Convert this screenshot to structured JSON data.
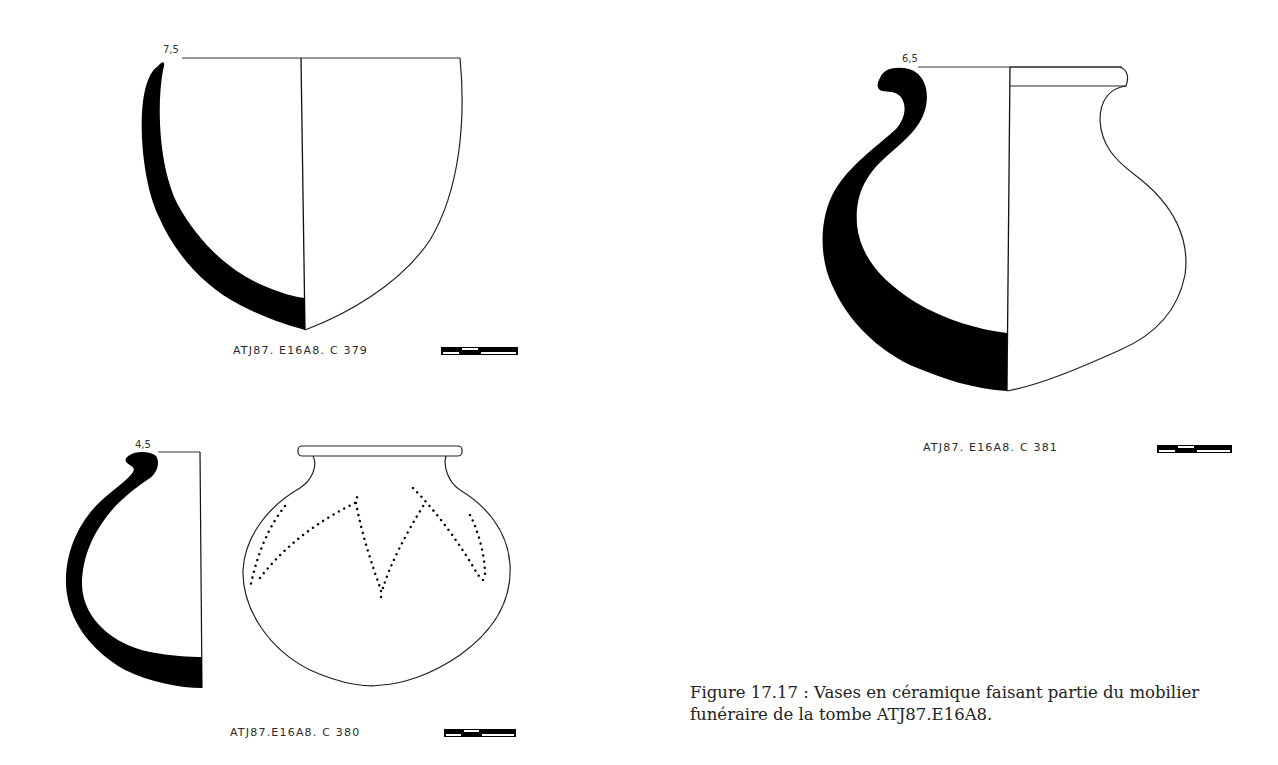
{
  "figure": {
    "caption": "Figure 17.17 : Vases en céramique faisant partie du mobilier funéraire de la tombe ATJ87.E16A8.",
    "caption_line1": "Figure 17.17 : Vases en céramique faisant partie du mobilier",
    "caption_line2": "funéraire de la tombe ATJ87.E16A8.",
    "vessels": [
      {
        "id": "C379",
        "label": "ATJ87. E16A8. C 379",
        "dimension": "7,5",
        "position": "top-left"
      },
      {
        "id": "C381",
        "label": "ATJ87. E16A8. C 381",
        "dimension": "6,5",
        "position": "top-right"
      },
      {
        "id": "C380",
        "label": "ATJ87.E16A8. C 380",
        "dimension": "4,5",
        "position": "bottom-left"
      }
    ],
    "scale_bar_icon": "scale-bar",
    "colors": {
      "ink": "#000000",
      "paper": "#ffffff",
      "text": "#222222"
    }
  }
}
